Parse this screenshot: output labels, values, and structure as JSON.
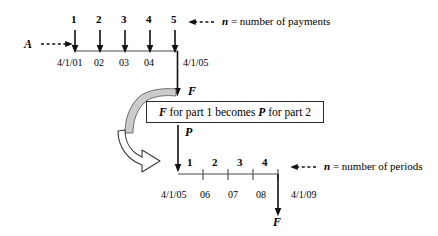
{
  "diagram": {
    "background_color": "#ffffff",
    "line_color": "#3a3a3a",
    "arrow_color": "#111111",
    "curve_fill_top": "#cfcfcf",
    "curve_fill_bottom": "#ffffff"
  },
  "top_timeline": {
    "series_label": "A",
    "payment_numbers": [
      "1",
      "2",
      "3",
      "4",
      "5"
    ],
    "date_labels": [
      "4/1/01",
      "02",
      "03",
      "04",
      "4/1/05"
    ],
    "annotation": {
      "italic_symbol": "n",
      "text": " = number of payments"
    },
    "future_value_label": "F"
  },
  "callout": {
    "text_parts": [
      "F",
      " for part 1 becomes ",
      "P",
      " for part 2"
    ],
    "full_text": "F for part 1 becomes P for part 2"
  },
  "bottom_timeline": {
    "present_value_label": "P",
    "period_numbers": [
      "1",
      "2",
      "3",
      "4"
    ],
    "date_labels": [
      "4/1/05",
      "06",
      "07",
      "08",
      "4/1/09"
    ],
    "annotation": {
      "italic_symbol": "n",
      "text": " = number of periods"
    },
    "future_value_label": "F"
  }
}
